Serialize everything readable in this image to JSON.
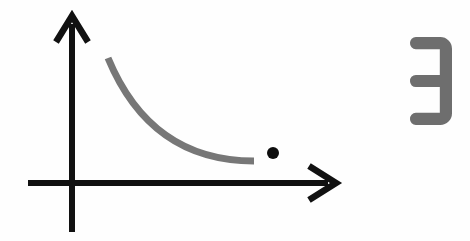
{
  "figure": {
    "title": "Decaying curve with axes, isolated point and glyph",
    "background_color": "#fefefe",
    "width": 470,
    "height": 241
  },
  "colors": {
    "axis": "#111111",
    "curve": "#777777",
    "point": "#0d0d0d",
    "glyph": "#6e6e6e",
    "background": "#fefefe"
  },
  "axes": {
    "origin": {
      "x": 72,
      "y": 183
    },
    "x_axis": {
      "label": "x-axis",
      "start_x": 28,
      "end_x": 336,
      "y": 183,
      "stroke_width": 6,
      "arrow": {
        "direction": "right",
        "tip_x": 336,
        "tip_y": 183,
        "half_height": 17,
        "length": 27
      }
    },
    "y_axis": {
      "label": "y-axis",
      "x": 72,
      "start_y": 232,
      "end_y": 16,
      "stroke_width": 6,
      "arrow": {
        "direction": "up",
        "tip_x": 72,
        "tip_y": 16,
        "half_width": 16,
        "length": 26
      }
    }
  },
  "curve": {
    "label": "decaying exponential curve",
    "stroke_width": 7,
    "color": "#777777",
    "start": {
      "x": 108,
      "y": 58
    },
    "end": {
      "x": 254,
      "y": 161
    },
    "control_1": {
      "x": 137,
      "y": 128
    },
    "control_2": {
      "x": 186,
      "y": 161
    }
  },
  "point": {
    "label": "isolated data point",
    "x": 273,
    "y": 153,
    "radius": 6,
    "color": "#0d0d0d"
  },
  "glyph": {
    "label": "mirrored-three",
    "character": "Ɛ",
    "color": "#6e6e6e",
    "bounds": {
      "x": 410,
      "y": 37,
      "width": 42,
      "height": 88
    }
  },
  "chart_data": {
    "type": "line",
    "title": "Decaying curve with isolated point",
    "xlabel": "",
    "ylabel": "",
    "grid": false,
    "legend": "none",
    "axis_style": "arrow-terminated cartesian axes, no tick marks, no tick labels",
    "xlim": [
      0,
      10
    ],
    "ylim": [
      0,
      10
    ],
    "series": [
      {
        "name": "decay curve",
        "type": "line",
        "color": "#777777",
        "x": [
          1.4,
          2.2,
          3.0,
          3.8,
          4.6,
          5.4,
          6.2,
          6.9
        ],
        "y": [
          7.5,
          5.5,
          4.1,
          3.2,
          2.5,
          2.0,
          1.7,
          1.5
        ]
      },
      {
        "name": "isolated point",
        "type": "scatter",
        "color": "#0d0d0d",
        "x": [
          7.6
        ],
        "y": [
          1.7
        ]
      }
    ],
    "annotations": [
      {
        "text": "Ɛ",
        "x": 9.4,
        "y": 8.0,
        "color": "#6e6e6e"
      }
    ]
  }
}
